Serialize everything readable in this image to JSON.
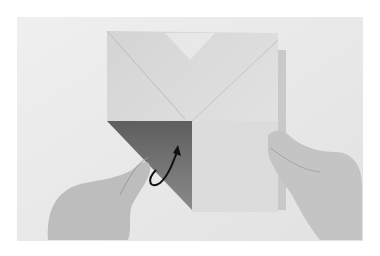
{
  "image": {
    "description": "Photograph of hands folding a square of origami paper; the lower-left flap is folded over showing the darker reverse side, with a curved black arrow indicating the fold direction.",
    "colors": {
      "page_background": "#ffffff",
      "photo_background": "#ececec",
      "paper_light": "#d8d8d8",
      "paper_dark_flap": "#6e6e6e",
      "arrow": "#111111",
      "skin": "#bdbdbd"
    }
  }
}
